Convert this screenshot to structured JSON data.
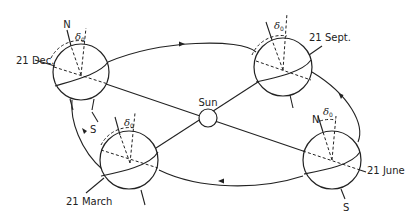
{
  "diagram": {
    "sun": {
      "label": "Sun"
    },
    "positions": [
      {
        "id": "dec",
        "label": "21 Dec.",
        "north_label": "N",
        "south_label": "",
        "angle_symbol": "δ",
        "angle_subscript": "0"
      },
      {
        "id": "sept",
        "label": "21 Sept.",
        "north_label": "",
        "south_label": "",
        "angle_symbol": "δ",
        "angle_subscript": "0"
      },
      {
        "id": "march",
        "label": "21 March",
        "north_label": "",
        "south_label": "S",
        "angle_symbol": "δ",
        "angle_subscript": "0"
      },
      {
        "id": "june",
        "label": "21 June",
        "north_label": "N",
        "south_label": "S",
        "angle_symbol": "δ",
        "angle_subscript": "0"
      }
    ],
    "colors": {
      "ink": "#222222",
      "background": "#ffffff"
    }
  }
}
